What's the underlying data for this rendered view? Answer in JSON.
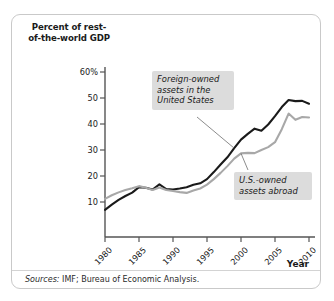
{
  "figure": {
    "y_axis_title": "Percent of rest-of-the-world GDP",
    "x_axis_title": "Year",
    "source_prefix": "Sources:",
    "source_text": "IMF; Bureau of Economic Analysis.",
    "annotation_foreign": "Foreign-owned assets in the United States",
    "annotation_usowned": "U.S.-owned assets abroad",
    "colors": {
      "series_foreign": "#1a1a1a",
      "series_usowned": "#a8a8a8",
      "axis": "#555555",
      "annotation_background": "#dcdcdc",
      "frame_border": "#c9c9c9",
      "page_background": "#ffffff"
    }
  },
  "chart_data": {
    "type": "line",
    "title": "",
    "subtitle": "",
    "xlabel": "Year",
    "ylabel": "Percent of rest-of-the-world GDP",
    "xlim": [
      1980,
      2010
    ],
    "ylim": [
      0,
      63
    ],
    "grid": false,
    "legend_position": "inline-annotations",
    "x_tick_labels": [
      "1980",
      "1985",
      "1990",
      "1995",
      "2000",
      "2005",
      "2010"
    ],
    "x_ticks": [
      1980,
      1985,
      1990,
      1995,
      2000,
      2005,
      2010
    ],
    "y_tick_labels": [
      "10",
      "20",
      "30",
      "40",
      "50",
      "60%"
    ],
    "y_ticks": [
      10,
      20,
      30,
      40,
      50,
      60
    ],
    "x": [
      1980,
      1981,
      1982,
      1983,
      1984,
      1985,
      1986,
      1987,
      1988,
      1989,
      1990,
      1991,
      1992,
      1993,
      1994,
      1995,
      1996,
      1997,
      1998,
      1999,
      2000,
      2001,
      2002,
      2003,
      2004,
      2005,
      2006,
      2007,
      2008,
      2009,
      2010
    ],
    "series": [
      {
        "name": "Foreign-owned assets in the United States",
        "color": "#1a1a1a",
        "values": [
          7.0,
          9.0,
          10.8,
          12.3,
          13.6,
          15.7,
          15.5,
          14.8,
          16.8,
          15.0,
          14.8,
          15.2,
          15.7,
          16.6,
          17.2,
          18.8,
          21.5,
          24.4,
          27.2,
          30.7,
          34.0,
          36.2,
          38.2,
          37.4,
          39.8,
          43.0,
          46.5,
          49.2,
          48.8,
          48.9,
          47.8
        ]
      },
      {
        "name": "U.S.-owned assets abroad",
        "color": "#a8a8a8",
        "values": [
          11.2,
          12.6,
          13.7,
          14.6,
          15.3,
          16.1,
          15.5,
          14.6,
          15.6,
          14.6,
          14.2,
          13.8,
          13.5,
          14.4,
          15.2,
          16.7,
          18.8,
          21.2,
          23.8,
          26.7,
          28.7,
          28.9,
          28.8,
          30.0,
          31.1,
          33.0,
          38.0,
          44.0,
          41.6,
          42.7,
          42.5
        ]
      }
    ],
    "annotations": [
      {
        "text": "Foreign-owned assets in the United States",
        "target_series": "Foreign-owned assets in the United States",
        "target_x": 1999
      },
      {
        "text": "U.S.-owned assets abroad",
        "target_series": "U.S.-owned assets abroad",
        "target_x": 2000
      }
    ]
  }
}
